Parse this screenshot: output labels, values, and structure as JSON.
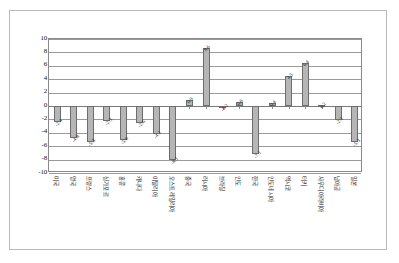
{
  "chart_data": {
    "type": "bar",
    "title": "",
    "subtitle": "",
    "xlabel": "",
    "ylabel": "",
    "ylim": [
      -10,
      10
    ],
    "grid": true,
    "legend": "none",
    "orientation": "vertical",
    "yticks": [
      "10",
      "8",
      "6",
      "4",
      "2",
      "0",
      "-2",
      "-4",
      "-6",
      "-8",
      "-10"
    ],
    "ytick_values": [
      10,
      8,
      6,
      4,
      2,
      0,
      -2,
      -4,
      -6,
      -8,
      -10
    ],
    "categories": [
      "미국",
      "영국",
      "프랑스",
      "싱가포르",
      "홍콩",
      "캐나다",
      "이탈리아",
      "오스트레일리아",
      "중국",
      "러시아",
      "브라질",
      "인도",
      "한국",
      "인도네시아",
      "멕시코",
      "터키",
      "사우디아라비아",
      "남아공",
      "일본"
    ],
    "values": [
      -2.4,
      -4.8,
      -5.3,
      -2.3,
      -5.0,
      -2.6,
      -4.2,
      -8.1,
      0.9,
      8.6,
      -0.2,
      0.6,
      -7.1,
      0.4,
      4.5,
      6.4,
      0.2,
      -2.1,
      -5.3
    ],
    "data_labels": [
      "-2.4",
      "-4.8",
      "-5.3",
      "-2.3",
      "-5.0",
      "-2.6",
      "-4.2",
      "-8.1",
      "0.9",
      "8.6",
      "-0.2",
      "0.6",
      "-7.1",
      "0.4",
      "4.5",
      "6.4",
      "0.2",
      "-2.1",
      "-5.3"
    ],
    "series": [
      {
        "name": "",
        "values": [
          -2.4,
          -4.8,
          -5.3,
          -2.3,
          -5.0,
          -2.6,
          -4.2,
          -8.1,
          0.9,
          8.6,
          -0.2,
          0.6,
          -7.1,
          0.4,
          4.5,
          6.4,
          0.2,
          -2.1,
          -5.3
        ]
      }
    ],
    "colors": {
      "bar_fill": "#b6b6b6",
      "bar_stroke": "#6d6d6d",
      "gridline": "#9a9a9a",
      "plot_border": "#8a8a8a",
      "frame_border": "#b9b9b9",
      "background": "#ffffff",
      "text": "#1a1a1a"
    }
  }
}
